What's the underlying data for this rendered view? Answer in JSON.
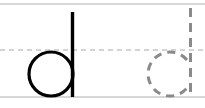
{
  "worksheet": {
    "type": "handwriting-practice",
    "model_letter": "d",
    "trace_letter": "d",
    "guide_lines": {
      "top": {
        "y": 4,
        "style": "solid",
        "color": "#b0b0b0"
      },
      "midline": {
        "y": 50,
        "style": "dashed",
        "color": "#a8a8a8"
      },
      "baseline": {
        "y": 97,
        "style": "solid",
        "color": "#b0b0b0"
      }
    },
    "colors": {
      "model_stroke": "#000000",
      "trace_stroke": "#8a8a8a"
    }
  }
}
